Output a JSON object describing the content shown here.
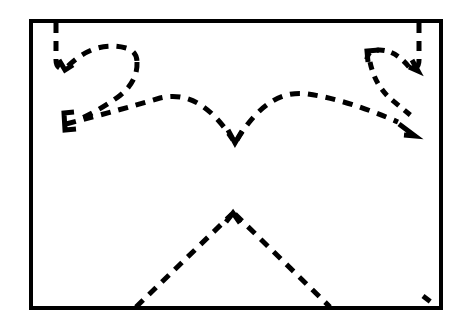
{
  "figure": {
    "title": "",
    "caption": "",
    "type": "line-art-diagram",
    "background_color": "#ffffff",
    "ink_color": "#000000",
    "canvas": {
      "width": 463,
      "height": 325
    },
    "frame": {
      "name": "rectangular border",
      "x": 31,
      "y": 21,
      "width": 410,
      "height": 287,
      "stroke_width": 4,
      "stroke_color": "#000000",
      "fill": "none"
    },
    "stroke_style": {
      "dash_pattern": "10 8",
      "dash_pattern_fine": "8 7",
      "stroke_width": 5,
      "line_cap": "butt",
      "line_join": "miter"
    },
    "strokes": [
      {
        "name": "left-hook-descender",
        "description": "vertical dashed line descending from top border then turning right",
        "path": "M 56 23 L 56 60 Q 56 70 66 69",
        "dash": "10 8",
        "width": 5
      },
      {
        "name": "left-hook-arrowhead",
        "description": "small down-left arrowhead at end of left descender",
        "path": "M 59 60 L 65 70 L 73 65",
        "dash": "none",
        "width": 5
      },
      {
        "name": "left-loop-upper",
        "description": "upper arc of the left loop sweeping right",
        "path": "M 68 66 Q 95 40 126 48 Q 137 51 137 62",
        "dash": "10 8",
        "width": 5
      },
      {
        "name": "left-loop-lower",
        "description": "lower return of the left loop curving down-left",
        "path": "M 137 62 Q 138 82 118 97 Q 100 110 78 120",
        "dash": "10 8",
        "width": 5
      },
      {
        "name": "left-bracket-arrowhead",
        "description": "left-pointing C shaped arrowhead terminating the left loop",
        "path": "M 74 112 L 64 113 L 65 130 L 76 129",
        "dash": "none",
        "width": 5
      },
      {
        "name": "left-arc-to-center",
        "description": "long dashed arc rising from left bracket over to central valley",
        "path": "M 66 124 Q 120 110 160 98 Q 200 88 233 140",
        "dash": "10 8",
        "width": 5
      },
      {
        "name": "center-valley",
        "description": "V notch where the two central arcs meet",
        "path": "M 228 130 L 235 143 L 242 131",
        "dash": "none",
        "width": 5
      },
      {
        "name": "right-arc-to-center",
        "description": "long dashed arc from the central valley rising to the right side",
        "path": "M 237 140 Q 268 88 308 94 Q 348 100 398 122",
        "dash": "10 8",
        "width": 5
      },
      {
        "name": "right-hook-descender",
        "description": "vertical dashed line descending from top border on the right",
        "path": "M 419 23 L 419 60 Q 419 70 410 69",
        "dash": "10 8",
        "width": 5
      },
      {
        "name": "right-hook-arrowhead",
        "description": "small down-right arrowhead at end of right descender",
        "path": "M 412 60 L 418 71 L 409 67",
        "dash": "none",
        "width": 5
      },
      {
        "name": "right-loop-upper",
        "description": "upper arc of the right loop sweeping left",
        "path": "M 409 67 Q 392 46 372 51 Q 366 54 367 63",
        "dash": "8 7",
        "width": 5
      },
      {
        "name": "right-bracket-corner",
        "description": "corner bracket at the top-left of the right loop",
        "path": "M 379 50 L 367 51 L 368 62",
        "dash": "none",
        "width": 5
      },
      {
        "name": "right-loop-lower",
        "description": "lower return of the right loop curving down-right",
        "path": "M 370 62 Q 375 86 392 100 Q 404 110 414 118",
        "dash": "8 7",
        "width": 5
      },
      {
        "name": "right-terminal-arrowhead",
        "description": "down-right arrowhead terminating the right loop",
        "path": "M 399 124 L 415 136 L 404 135",
        "dash": "none",
        "width": 5
      },
      {
        "name": "mountain-left-slope",
        "description": "dashed ascending line from bottom border to the central peak",
        "path": "M 136 307 L 232 214",
        "dash": "10 8",
        "width": 5
      },
      {
        "name": "mountain-peak",
        "description": "apex of the lower mountain shape",
        "path": "M 226 222 L 233 213 L 240 223",
        "dash": "none",
        "width": 5
      },
      {
        "name": "mountain-right-slope",
        "description": "dashed descending line from the central peak to the bottom border",
        "path": "M 235 214 L 330 307",
        "dash": "10 8",
        "width": 5
      },
      {
        "name": "bottom-right-corner-tick",
        "description": "short dashed segment near the bottom right corner",
        "path": "M 423 296 L 435 305",
        "dash": "9 6",
        "width": 5
      }
    ]
  }
}
